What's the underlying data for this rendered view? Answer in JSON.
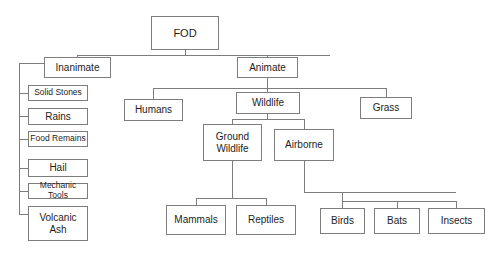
{
  "diagram": {
    "type": "tree-diagram",
    "style": {
      "background": "#ffffff",
      "box_border": "#7d7d7d",
      "connector": "#7d7d7d",
      "text": "#1d1d1d"
    },
    "nodes": [
      {
        "id": "fod",
        "label": "FOD",
        "x": 151,
        "y": 16,
        "w": 68,
        "h": 34,
        "size": "t11"
      },
      {
        "id": "inanimate",
        "label": "Inanimate",
        "x": 44,
        "y": 57,
        "w": 67,
        "h": 21,
        "size": "t10"
      },
      {
        "id": "animate",
        "label": "Animate",
        "x": 237,
        "y": 57,
        "w": 61,
        "h": 21,
        "size": "t10"
      },
      {
        "id": "solid-stones",
        "label": "Solid Stones",
        "x": 28,
        "y": 85,
        "w": 60,
        "h": 16,
        "size": "t9"
      },
      {
        "id": "rains",
        "label": "Rains",
        "x": 28,
        "y": 108,
        "w": 60,
        "h": 17,
        "size": "t10"
      },
      {
        "id": "food-remains",
        "label": "Food Remains",
        "x": 28,
        "y": 131,
        "w": 60,
        "h": 16,
        "size": "t9"
      },
      {
        "id": "hail",
        "label": "Hail",
        "x": 28,
        "y": 159,
        "w": 60,
        "h": 18,
        "size": "t10"
      },
      {
        "id": "mechanic-tools",
        "label": "Mechanic Tools",
        "x": 28,
        "y": 183,
        "w": 60,
        "h": 16,
        "size": "t9"
      },
      {
        "id": "volcanic-ash",
        "label": "Volcanic\nAsh",
        "x": 28,
        "y": 206,
        "w": 60,
        "h": 35,
        "size": "t10"
      },
      {
        "id": "humans",
        "label": "Humans",
        "x": 124,
        "y": 99,
        "w": 59,
        "h": 22,
        "size": "t10"
      },
      {
        "id": "wildlife",
        "label": "Wildlife",
        "x": 236,
        "y": 92,
        "w": 64,
        "h": 22,
        "size": "t10"
      },
      {
        "id": "grass",
        "label": "Grass",
        "x": 360,
        "y": 97,
        "w": 52,
        "h": 22,
        "size": "t10"
      },
      {
        "id": "ground-wildlife",
        "label": "Ground\nWildlife",
        "x": 203,
        "y": 124,
        "w": 59,
        "h": 37,
        "size": "t10"
      },
      {
        "id": "airborne",
        "label": "Airborne",
        "x": 274,
        "y": 129,
        "w": 60,
        "h": 32,
        "size": "t10"
      },
      {
        "id": "mammals",
        "label": "Mammals",
        "x": 166,
        "y": 205,
        "w": 60,
        "h": 30,
        "size": "t10"
      },
      {
        "id": "reptiles",
        "label": "Reptiles",
        "x": 236,
        "y": 205,
        "w": 60,
        "h": 30,
        "size": "t10"
      },
      {
        "id": "birds",
        "label": "Birds",
        "x": 320,
        "y": 208,
        "w": 45,
        "h": 26,
        "size": "t10"
      },
      {
        "id": "bats",
        "label": "Bats",
        "x": 374,
        "y": 208,
        "w": 46,
        "h": 26,
        "size": "t10"
      },
      {
        "id": "insects",
        "label": "Insects",
        "x": 428,
        "y": 208,
        "w": 57,
        "h": 26,
        "size": "t10"
      }
    ],
    "edges": [
      {
        "from": "fod",
        "to": "inanimate"
      },
      {
        "from": "fod",
        "to": "animate"
      },
      {
        "from": "inanimate",
        "to": "solid-stones"
      },
      {
        "from": "inanimate",
        "to": "rains"
      },
      {
        "from": "inanimate",
        "to": "food-remains"
      },
      {
        "from": "inanimate",
        "to": "hail"
      },
      {
        "from": "inanimate",
        "to": "mechanic-tools"
      },
      {
        "from": "inanimate",
        "to": "volcanic-ash"
      },
      {
        "from": "animate",
        "to": "humans"
      },
      {
        "from": "animate",
        "to": "wildlife"
      },
      {
        "from": "animate",
        "to": "grass"
      },
      {
        "from": "wildlife",
        "to": "ground-wildlife"
      },
      {
        "from": "wildlife",
        "to": "airborne"
      },
      {
        "from": "ground-wildlife",
        "to": "mammals"
      },
      {
        "from": "ground-wildlife",
        "to": "reptiles"
      },
      {
        "from": "airborne",
        "to": "birds"
      },
      {
        "from": "airborne",
        "to": "bats"
      },
      {
        "from": "airborne",
        "to": "insects"
      }
    ]
  }
}
